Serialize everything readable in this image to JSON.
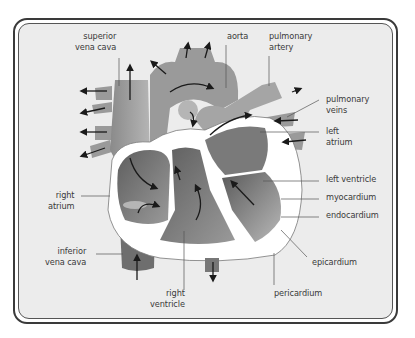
{
  "diagram": {
    "colors": {
      "frame_border": "#3a3a3a",
      "background": "#ececec",
      "vessel_light": "#a9a9a9",
      "chamber_dark": "#6a6a6a",
      "wall_white": "#ffffff",
      "arrow": "#1a1a1a",
      "leader_line": "#555555"
    },
    "labels": {
      "superior_vena_cava": "superior\nvena cava",
      "aorta": "aorta",
      "pulmonary_artery": "pulmonary\nartery",
      "pulmonary_veins": "pulmonary\nveins",
      "left_atrium": "left\natrium",
      "left_ventricle": "left ventricle",
      "myocardium": "myocardium",
      "endocardium": "endocardium",
      "epicardium": "epicardium",
      "pericardium": "pericardium",
      "right_ventricle": "right\nventricle",
      "inferior_vena_cava": "inferior\nvena cava",
      "right_atrium": "right\natrium"
    }
  }
}
